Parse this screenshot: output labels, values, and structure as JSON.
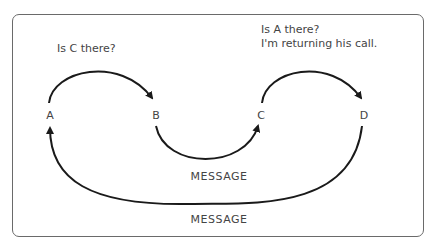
{
  "diagram": {
    "type": "call-forwarding message flow",
    "nodes": [
      {
        "id": "A",
        "label": "A"
      },
      {
        "id": "B",
        "label": "B"
      },
      {
        "id": "C",
        "label": "C"
      },
      {
        "id": "D",
        "label": "D"
      }
    ],
    "edges": [
      {
        "from": "A",
        "to": "B",
        "label": "Is C there?"
      },
      {
        "from": "B",
        "to": "C",
        "label": "MESSAGE"
      },
      {
        "from": "C",
        "to": "D",
        "label_line1": "Is A there?",
        "label_line2": "I'm returning his call."
      },
      {
        "from": "D",
        "to": "A",
        "label": "MESSAGE"
      }
    ],
    "colors": {
      "stroke": "#1a1a1a",
      "text": "#444444",
      "frame": "#6a6a6a"
    }
  }
}
